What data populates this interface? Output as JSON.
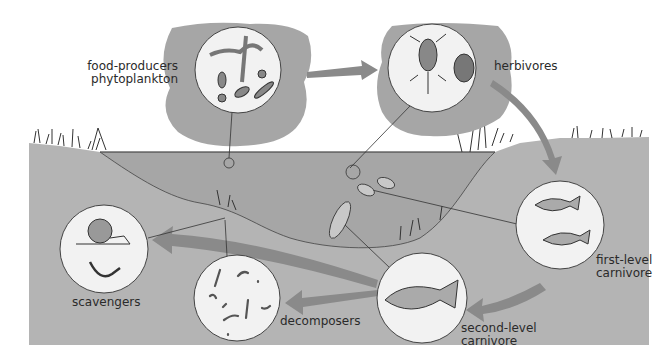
{
  "diagram": {
    "colors": {
      "background": "#ffffff",
      "ground": "#b4b4b4",
      "water": "#a9a9a9",
      "blob": "#a6a6a6",
      "arrow": "#8a8a8a",
      "circle_fill": "#f2f2f2",
      "stroke": "#333333"
    },
    "nodes": [
      {
        "id": "producers",
        "label_line1": "food-producers",
        "label_line2": "phytoplankton",
        "icon": "phytoplankton-icon"
      },
      {
        "id": "herbivores",
        "label_line1": "herbivores",
        "icon": "zooplankton-icon"
      },
      {
        "id": "first_carnivore",
        "label_line1": "first-level",
        "label_line2": "carnivore",
        "icon": "small-fish-icon"
      },
      {
        "id": "second_carnivore",
        "label_line1": "second-level",
        "label_line2": "carnivore",
        "icon": "large-fish-icon"
      },
      {
        "id": "decomposers",
        "label_line1": "decomposers",
        "icon": "bacteria-icon"
      },
      {
        "id": "scavengers",
        "label_line1": "scavengers",
        "icon": "snail-crayfish-icon"
      }
    ],
    "flows": [
      {
        "from": "producers",
        "to": "herbivores"
      },
      {
        "from": "herbivores",
        "to": "first_carnivore"
      },
      {
        "from": "first_carnivore",
        "to": "second_carnivore"
      },
      {
        "from": "second_carnivore",
        "to": "decomposers"
      },
      {
        "from": "second_carnivore",
        "to": "scavengers"
      }
    ]
  }
}
